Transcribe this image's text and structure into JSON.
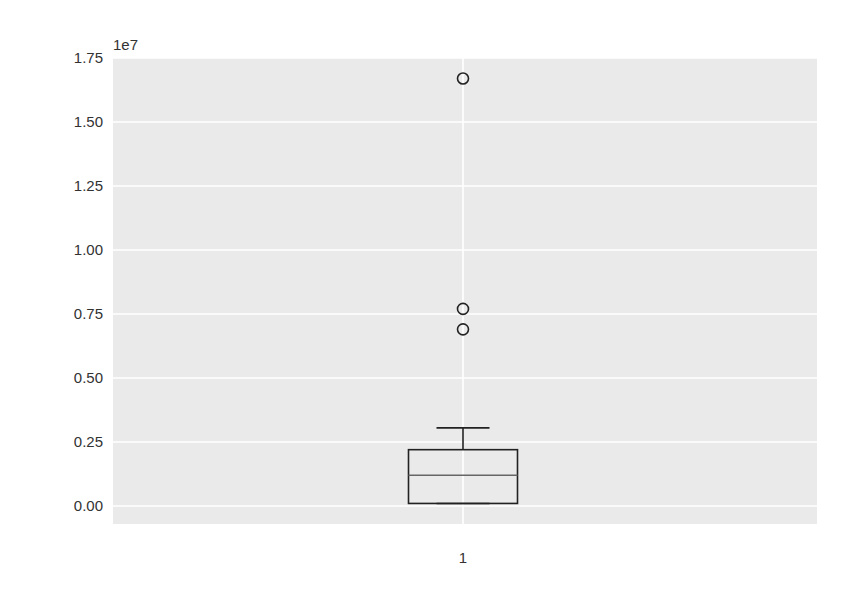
{
  "chart_data": {
    "type": "boxplot",
    "title": "",
    "xlabel": "",
    "ylabel": "",
    "y_offset_label": "1e7",
    "ylim": [
      -0.07,
      1.75
    ],
    "y_scale": 10000000,
    "y_ticks": [
      0.0,
      0.25,
      0.5,
      0.75,
      1.0,
      1.25,
      1.5,
      1.75
    ],
    "y_tick_labels": [
      "0.00",
      "0.25",
      "0.50",
      "0.75",
      "1.00",
      "1.25",
      "1.50",
      "1.75"
    ],
    "categories": [
      "1"
    ],
    "grid": true,
    "background": "#eaeaea",
    "series": [
      {
        "name": "1",
        "whisker_low": 0.01,
        "q1": 0.01,
        "median": 0.12,
        "q3": 0.22,
        "whisker_high": 0.305,
        "outliers": [
          0.69,
          0.77,
          1.67
        ]
      }
    ]
  }
}
